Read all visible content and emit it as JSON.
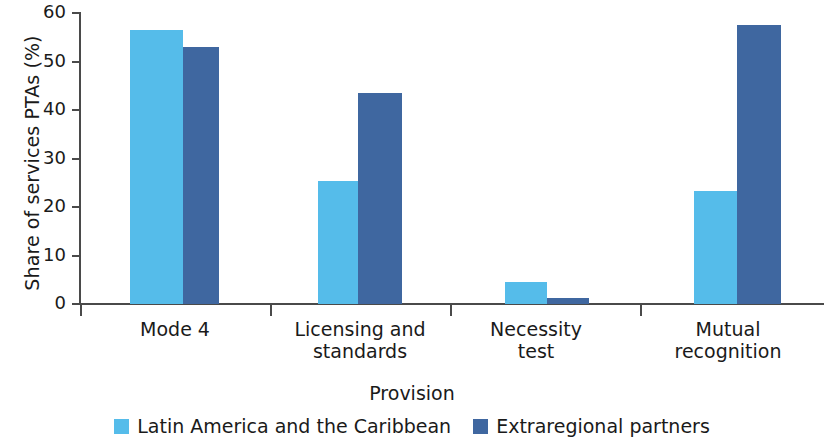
{
  "chart_data": {
    "type": "bar",
    "title": "",
    "xlabel": "Provision",
    "ylabel": "Share of services PTAs (%)",
    "categories": [
      "Mode 4",
      "Licensing and\nstandards",
      "Necessity\ntest",
      "Mutual\nrecognition"
    ],
    "category_lines": [
      [
        "Mode 4"
      ],
      [
        "Licensing and",
        "standards"
      ],
      [
        "Necessity",
        "test"
      ],
      [
        "Mutual",
        "recognition"
      ]
    ],
    "series": [
      {
        "name": "Latin America and the Caribbean",
        "color": "#55BCEA",
        "values": [
          56.6,
          25.3,
          4.5,
          23.2
        ]
      },
      {
        "name": "Extraregional partners",
        "color": "#3F67A0",
        "values": [
          52.9,
          43.5,
          1.3,
          57.5
        ]
      }
    ],
    "ylim": [
      0,
      60
    ],
    "yticks": [
      0,
      10,
      20,
      30,
      40,
      50,
      60
    ],
    "ytick_labels": [
      "0",
      "10",
      "20",
      "30",
      "40",
      "50",
      "60"
    ],
    "grid": false,
    "legend_position": "bottom"
  },
  "axes": {
    "y_title": "Share of services PTAs (%)",
    "x_title": "Provision"
  },
  "legend": {
    "items": [
      {
        "label": "Latin America and the Caribbean",
        "color": "#55BCEA"
      },
      {
        "label": "Extraregional partners",
        "color": "#3F67A0"
      }
    ]
  },
  "colors": {
    "series_light": "#55BCEA",
    "series_dark": "#3F67A0",
    "axis": "#4a4a4a",
    "text": "#1a1a1a",
    "background": "#ffffff"
  }
}
